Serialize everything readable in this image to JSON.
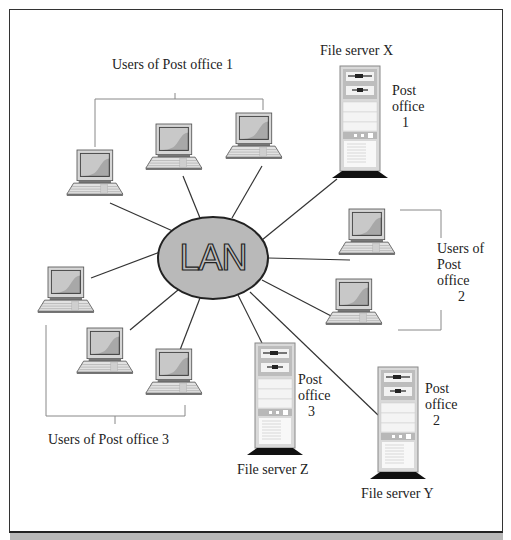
{
  "diagram": {
    "hub": {
      "label": "LAN",
      "fill": "#b9b9b9",
      "stroke": "#222222"
    },
    "servers": [
      {
        "id": "x",
        "name": "File server X",
        "post_office_line1": "Post",
        "post_office_line2": "office",
        "post_office_num": "1"
      },
      {
        "id": "z",
        "name": "File server Z",
        "post_office_line1": "Post",
        "post_office_line2": "office",
        "post_office_num": "3"
      },
      {
        "id": "y",
        "name": "File server Y",
        "post_office_line1": "Post",
        "post_office_line2": "office",
        "post_office_num": "2"
      }
    ],
    "user_groups": [
      {
        "id": "po1",
        "label": "Users of Post office 1",
        "count": 3
      },
      {
        "id": "po2",
        "label_line1": "Users of",
        "label_line2": "Post",
        "label_line3": "office",
        "label_line4": "2",
        "count": 2
      },
      {
        "id": "po3",
        "label": "Users of Post office 3",
        "count": 3
      }
    ],
    "colors": {
      "screen": "#9a9a9a",
      "screen_light": "#c4c4c4",
      "bezel": "#d6d6d6",
      "server_body": "#d9d9d9",
      "line": "#333333",
      "bracket": "#888888"
    }
  }
}
